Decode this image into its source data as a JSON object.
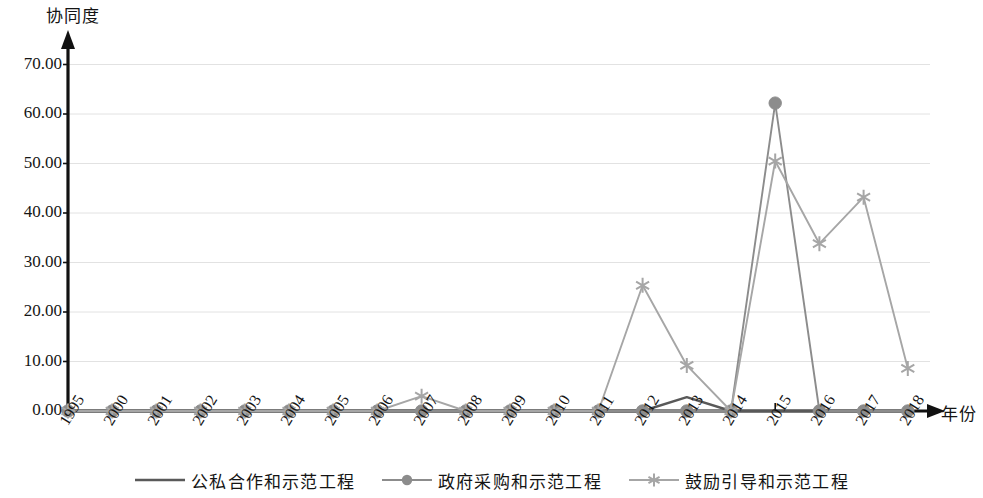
{
  "chart_data": {
    "type": "line",
    "title": "",
    "subtitle": "",
    "xlabel": "年份",
    "ylabel": "协同度",
    "ylim": [
      0,
      70
    ],
    "ytick_step": 10,
    "grid": true,
    "legend_position": "bottom",
    "ytick_labels": [
      "70.00",
      "60.00",
      "50.00",
      "40.00",
      "30.00",
      "20.00",
      "10.00",
      "0.00"
    ],
    "ytick_values": [
      70,
      60,
      50,
      40,
      30,
      20,
      10,
      0
    ],
    "categories": [
      "1995",
      "2000",
      "2001",
      "2002",
      "2003",
      "2004",
      "2005",
      "2006",
      "2007",
      "2008",
      "2009",
      "2010",
      "2011",
      "2012",
      "2013",
      "2014",
      "2015",
      "2016",
      "2017",
      "2018"
    ],
    "series": [
      {
        "name": "公私合作和示范工程",
        "marker": "none",
        "color": "#595959",
        "values": [
          0,
          0,
          0,
          0,
          0,
          0,
          0,
          0,
          0,
          0,
          0,
          0,
          0,
          0,
          2.8,
          0,
          0,
          0,
          0,
          0
        ]
      },
      {
        "name": "政府采购和示范工程",
        "marker": "circle",
        "color": "#8c8c8c",
        "values": [
          0,
          0,
          0,
          0,
          0,
          0,
          0,
          0,
          0,
          0,
          0,
          0,
          0,
          0,
          0,
          0,
          62.2,
          0,
          0,
          0
        ]
      },
      {
        "name": "鼓励引导和示范工程",
        "marker": "star",
        "color": "#a6a6a6",
        "values": [
          0,
          0,
          0,
          0,
          0,
          0,
          0,
          0,
          3.0,
          0,
          0,
          0,
          0,
          25.4,
          9.2,
          0,
          50.5,
          33.8,
          43.2,
          8.6
        ]
      }
    ]
  },
  "axis": {
    "x_label": "年份",
    "y_label": "协同度"
  },
  "legend": {
    "items": [
      {
        "label": "公私合作和示范工程",
        "marker": "line",
        "color": "#595959"
      },
      {
        "label": "政府采购和示范工程",
        "marker": "circle",
        "color": "#8c8c8c"
      },
      {
        "label": "鼓励引导和示范工程",
        "marker": "star",
        "color": "#a6a6a6"
      }
    ]
  },
  "colors": {
    "axis": "#111111",
    "grid": "#e2e2e2",
    "series1": "#595959",
    "series2": "#8c8c8c",
    "series3": "#a6a6a6",
    "background": "#ffffff"
  }
}
